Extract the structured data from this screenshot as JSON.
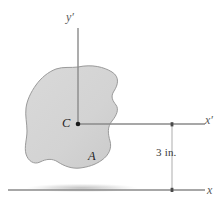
{
  "figure": {
    "type": "engineering-mechanics-centroid-diagram",
    "labels": {
      "y_prime_axis": "y′",
      "x_prime_axis": "x′",
      "x_axis": "x",
      "centroid": "C",
      "area": "A",
      "dimension": "3 in."
    },
    "dimension": {
      "value": 3,
      "unit": "in.",
      "text": "3 in.",
      "from_axis": "x′",
      "to_axis": "x"
    },
    "colors": {
      "shape_fill": "#d4d4d4",
      "shape_stroke": "#9a9a9a",
      "axis_line": "#8a8a8a",
      "dimension_line": "#b0b0b0",
      "label_text": "#2b2b2b",
      "centroid_dot": "#1a1a1a",
      "background": "#ffffff"
    },
    "geometry": {
      "centroid_point": {
        "x": 78,
        "y": 124
      },
      "y_prime_axis": {
        "x": 78,
        "y_top": 28,
        "y_bottom": 124
      },
      "x_prime_axis": {
        "y": 124,
        "x_left": 78,
        "x_right": 205
      },
      "x_axis": {
        "y": 190,
        "x_left": 8,
        "x_right": 205
      },
      "dimension_line": {
        "x": 172,
        "y_top": 124,
        "y_bottom": 190
      }
    }
  }
}
